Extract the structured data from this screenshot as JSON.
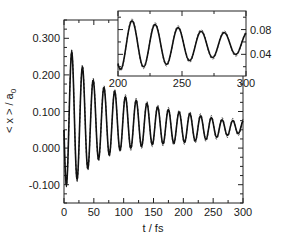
{
  "chart_data": {
    "type": "line",
    "title": "",
    "xlabel": "t / fs",
    "ylabel": "< x > / a0",
    "ylabel_parts": {
      "main": "< x > / a",
      "sub": "0"
    },
    "xlim": [
      0,
      300
    ],
    "ylim": [
      -0.15,
      0.35
    ],
    "xticks": [
      0,
      50,
      100,
      150,
      200,
      250,
      300
    ],
    "xtick_labels": [
      "0",
      "50",
      "100",
      "150",
      "200",
      "250",
      "300"
    ],
    "yticks": [
      -0.1,
      0.0,
      0.1,
      0.2,
      0.3
    ],
    "ytick_labels": [
      "-0.100",
      "0.000",
      "0.100",
      "0.200",
      "0.300"
    ],
    "grid": false,
    "legend": null,
    "series": [
      {
        "name": "solid",
        "style": "solid",
        "color": "#111111"
      },
      {
        "name": "dashed",
        "style": "dashed",
        "color": "#111111"
      }
    ],
    "model": {
      "period_fs": 18.0,
      "first_peak_t": 13.0,
      "peaks": [
        [
          13,
          0.262
        ],
        [
          31,
          0.221
        ],
        [
          49,
          0.185
        ],
        [
          67,
          0.165
        ],
        [
          85,
          0.155
        ],
        [
          103,
          0.14
        ],
        [
          121,
          0.13
        ],
        [
          139,
          0.122
        ],
        [
          157,
          0.112
        ],
        [
          175,
          0.105
        ],
        [
          193,
          0.098
        ],
        [
          211,
          0.094
        ],
        [
          229,
          0.088
        ],
        [
          247,
          0.083
        ],
        [
          265,
          0.077
        ],
        [
          283,
          0.075
        ]
      ],
      "troughs": [
        [
          4,
          -0.1
        ],
        [
          22,
          -0.085
        ],
        [
          40,
          -0.055
        ],
        [
          58,
          -0.03
        ],
        [
          76,
          -0.018
        ],
        [
          94,
          -0.005
        ],
        [
          112,
          0.0
        ],
        [
          130,
          0.005
        ],
        [
          148,
          0.01
        ],
        [
          166,
          0.012
        ],
        [
          184,
          0.014
        ],
        [
          202,
          0.016
        ],
        [
          220,
          0.02
        ],
        [
          238,
          0.024
        ],
        [
          256,
          0.03
        ],
        [
          274,
          0.035
        ],
        [
          292,
          0.04
        ]
      ]
    },
    "inset": {
      "xlim": [
        200,
        300
      ],
      "ylim": [
        0.005,
        0.11
      ],
      "xticks": [
        200,
        250,
        300
      ],
      "xtick_labels": [
        "200",
        "250",
        "300"
      ],
      "yticks": [
        0.04,
        0.08
      ],
      "ytick_labels": [
        "0.04",
        "0.08"
      ],
      "ytick_side": "right"
    }
  }
}
